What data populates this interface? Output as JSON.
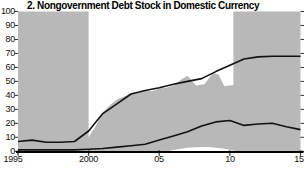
{
  "title": "2. Nongovernment Debt Stock in Domestic Currency",
  "colors": {
    "band": "#b8b8b8",
    "line": "#121212",
    "tick": "#333333",
    "axis": "#000000",
    "background": "#ffffff"
  },
  "axes": {
    "y_labels": [
      "100",
      "90",
      "80",
      "70",
      "60",
      "50",
      "40",
      "30",
      "20",
      "10",
      "0"
    ],
    "x_labels": [
      "1995",
      "2000",
      "05",
      "10",
      "15"
    ]
  },
  "chart_data": {
    "type": "area",
    "title": "2. Nongovernment Debt Stock in Domestic Currency",
    "xlabel": "",
    "ylabel": "",
    "xlim": [
      1995,
      2015
    ],
    "ylim": [
      0,
      100
    ],
    "grid": false,
    "legend": "none",
    "y_tick_values": [
      0,
      10,
      20,
      30,
      40,
      50,
      60,
      70,
      80,
      90,
      100
    ],
    "x_tick_values": [
      1995,
      2000,
      2005,
      2010,
      2015
    ],
    "x": [
      1995,
      1996,
      1997,
      1998,
      1999,
      2000,
      2001,
      2002,
      2003,
      2004,
      2005,
      2006,
      2007,
      2008,
      2009,
      2010,
      2011,
      2012,
      2013,
      2014,
      2015
    ],
    "series": [
      {
        "name": "upper line",
        "values": [
          7,
          8,
          6.5,
          6.5,
          7,
          14.5,
          27,
          34,
          41,
          43.5,
          45.5,
          48,
          50,
          52,
          57,
          61.5,
          66,
          67.5,
          68,
          68,
          68
        ]
      },
      {
        "name": "lower line",
        "values": [
          1,
          1,
          1,
          1,
          1,
          1.5,
          2,
          3,
          4,
          5,
          8,
          11,
          14,
          18,
          21,
          22,
          18.5,
          19.5,
          20,
          17.5,
          15.5
        ]
      }
    ],
    "range_area": {
      "description": "gray min-max range region; full height 1995-2000 and 2010.25-2015, jagged ridge between, with low dome lifting off zero 2005.6-2010.5",
      "polygon": [
        [
          1995,
          0
        ],
        [
          1995,
          100
        ],
        [
          2000,
          100
        ],
        [
          2000,
          10
        ],
        [
          2000.5,
          18
        ],
        [
          2001,
          28
        ],
        [
          2001.5,
          33
        ],
        [
          2002,
          37
        ],
        [
          2002.5,
          39
        ],
        [
          2003,
          41.5
        ],
        [
          2003.5,
          42
        ],
        [
          2004,
          43.5
        ],
        [
          2004.5,
          43
        ],
        [
          2005,
          45
        ],
        [
          2005.5,
          45.5
        ],
        [
          2006,
          47
        ],
        [
          2006.5,
          51
        ],
        [
          2007,
          54
        ],
        [
          2007.6,
          47
        ],
        [
          2008.2,
          48
        ],
        [
          2008.8,
          56
        ],
        [
          2009.2,
          55
        ],
        [
          2009.6,
          46.5
        ],
        [
          2010.25,
          47.5
        ],
        [
          2010.25,
          100
        ],
        [
          2015,
          100
        ],
        [
          2015,
          0
        ],
        [
          2010.5,
          0
        ],
        [
          2009.5,
          2
        ],
        [
          2008.5,
          3
        ],
        [
          2008,
          3
        ],
        [
          2007,
          2.5
        ],
        [
          2006,
          1
        ],
        [
          2005.6,
          0
        ]
      ]
    }
  }
}
